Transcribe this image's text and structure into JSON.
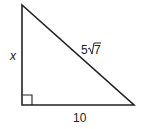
{
  "diagram": {
    "type": "right-triangle",
    "stroke_color": "#222222",
    "background": "#ffffff",
    "vertices": {
      "top": [
        22,
        5
      ],
      "right_angle": [
        22,
        105
      ],
      "bottom_right": [
        134,
        105
      ]
    },
    "labels": {
      "vertical_leg": "x",
      "hypotenuse_coefficient": "5",
      "hypotenuse_radicand": "7",
      "hypotenuse_full": "5√7",
      "horizontal_leg": "10"
    },
    "right_angle_marker": true
  }
}
